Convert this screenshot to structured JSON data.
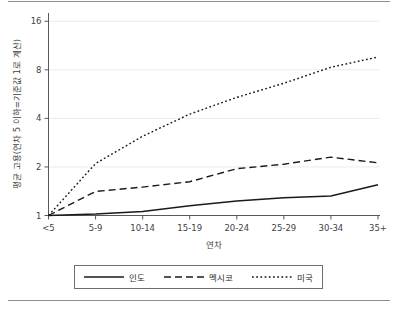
{
  "chart_data": {
    "type": "line",
    "title": "",
    "xlabel": "연차",
    "ylabel": "평균 고용(연차 5 이하=기준값 1로 계산)",
    "categories": [
      "<5",
      "5-9",
      "10-14",
      "15-19",
      "20-24",
      "25-29",
      "30-34",
      "35+"
    ],
    "yscale": "log2",
    "ylim": [
      1,
      18
    ],
    "yticks": [
      1,
      2,
      4,
      8,
      16
    ],
    "ytick_labels": [
      "1",
      "2",
      "4",
      "8",
      "16"
    ],
    "grid": "horizontal",
    "legend_position": "bottom",
    "series": [
      {
        "name": "인도",
        "style": "solid",
        "values": [
          1.0,
          1.02,
          1.06,
          1.15,
          1.23,
          1.29,
          1.32,
          1.55
        ]
      },
      {
        "name": "멕시코",
        "style": "dashed",
        "values": [
          1.0,
          1.41,
          1.5,
          1.62,
          1.95,
          2.08,
          2.3,
          2.12
        ]
      },
      {
        "name": "미국",
        "style": "dotted",
        "values": [
          1.0,
          2.1,
          3.1,
          4.25,
          5.4,
          6.6,
          8.3,
          9.6
        ]
      }
    ]
  },
  "axis": {
    "y_title": "평균 고용(연차 5 이하=기준값 1로 계산)",
    "x_title": "연차",
    "y_ticks": [
      "16",
      "8",
      "4",
      "2",
      "1"
    ],
    "x_ticks": [
      "<5",
      "5-9",
      "10-14",
      "15-19",
      "20-24",
      "25-29",
      "30-34",
      "35+"
    ]
  },
  "legend": {
    "items": [
      {
        "label": "인도",
        "style": "solid"
      },
      {
        "label": "멕시코",
        "style": "dashed"
      },
      {
        "label": "미국",
        "style": "dotted"
      }
    ]
  }
}
